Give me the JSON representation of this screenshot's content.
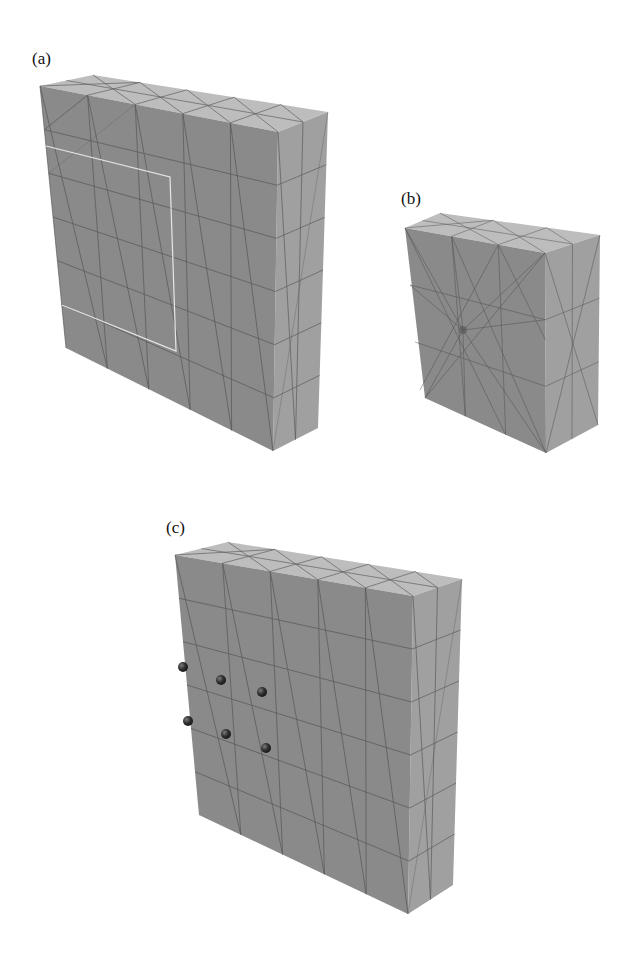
{
  "figure": {
    "panels": [
      {
        "id": "a",
        "label": "(a)",
        "description": "Coarse tetrahedral mesh slab with highlighted rectangular sub-region on front face"
      },
      {
        "id": "b",
        "label": "(b)",
        "description": "Smaller block with locally refined mesh at a point on front face"
      },
      {
        "id": "c",
        "label": "(c)",
        "description": "Coarse tetrahedral mesh slab with six marker spheres on front face"
      }
    ],
    "colors": {
      "background": "#ffffff",
      "top_face": "#bdbdbd",
      "front_face": "#8a8a8a",
      "side_face": "#a0a0a0",
      "mesh_line": "#4a4a4a",
      "highlight_outline": "#e6e6e6",
      "marker_sphere": "#2a2a2a"
    },
    "panel_c_markers": {
      "rows": 2,
      "cols": 3,
      "count": 6
    }
  }
}
